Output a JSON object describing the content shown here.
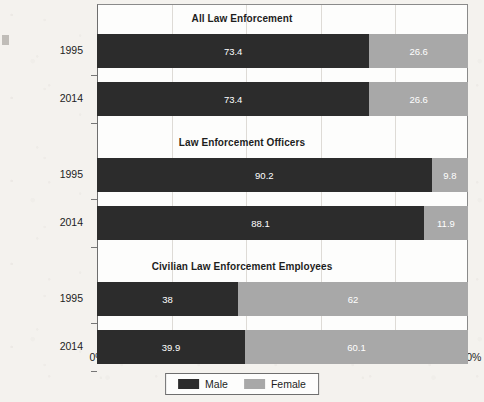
{
  "chart_data": {
    "type": "bar",
    "subtype": "horizontal-100-percent-stacked",
    "title": "",
    "xlabel": "",
    "ylabel": "",
    "xlim": [
      0,
      100
    ],
    "xticks": [
      "0%",
      "20%",
      "40%",
      "60%",
      "80%",
      "100%"
    ],
    "xtick_values": [
      0,
      20,
      40,
      60,
      80,
      100
    ],
    "grid": true,
    "grid_axis": "x",
    "legend_position": "bottom-center",
    "categories": [
      "1995",
      "2014",
      "1995",
      "2014",
      "1995",
      "2014"
    ],
    "series": [
      {
        "name": "Male",
        "color": "#2c2c2c",
        "values": [
          73.4,
          73.4,
          90.2,
          88.1,
          38,
          39.9
        ]
      },
      {
        "name": "Female",
        "color": "#a8a8a8",
        "values": [
          26.6,
          26.6,
          9.8,
          11.9,
          62,
          60.1
        ]
      }
    ],
    "groups": [
      {
        "title": "All Law Enforcement",
        "rows": [
          {
            "year": "1995",
            "male": 73.4,
            "female": 26.6,
            "male_label": "73.4",
            "female_label": "26.6"
          },
          {
            "year": "2014",
            "male": 73.4,
            "female": 26.6,
            "male_label": "73.4",
            "female_label": "26.6"
          }
        ]
      },
      {
        "title": "Law Enforcement Officers",
        "rows": [
          {
            "year": "1995",
            "male": 90.2,
            "female": 9.8,
            "male_label": "90.2",
            "female_label": "9.8"
          },
          {
            "year": "2014",
            "male": 88.1,
            "female": 11.9,
            "male_label": "88.1",
            "female_label": "11.9"
          }
        ]
      },
      {
        "title": "Civilian Law Enforcement Employees",
        "rows": [
          {
            "year": "1995",
            "male": 38,
            "female": 62,
            "male_label": "38",
            "female_label": "62"
          },
          {
            "year": "2014",
            "male": 39.9,
            "female": 60.1,
            "male_label": "39.9",
            "female_label": "60.1"
          }
        ]
      }
    ],
    "legend": [
      {
        "label": "Male",
        "color": "#2c2c2c"
      },
      {
        "label": "Female",
        "color": "#a8a8a8"
      }
    ]
  }
}
